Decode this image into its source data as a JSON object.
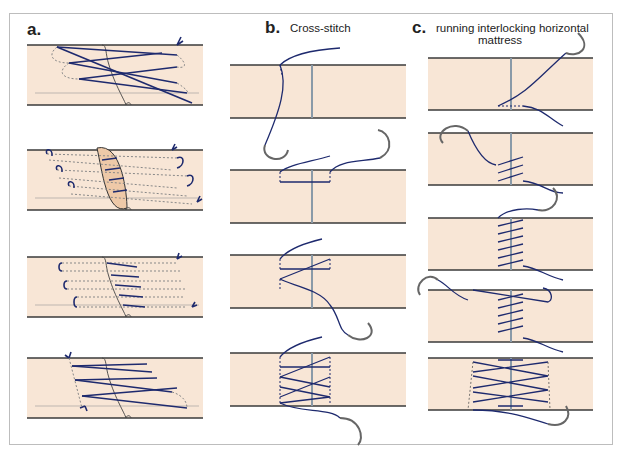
{
  "figure": {
    "panels": [
      {
        "letter": "a.",
        "title": "",
        "steps": 4
      },
      {
        "letter": "b.",
        "title": "Cross-stitch",
        "steps": 4
      },
      {
        "letter": "c.",
        "title_line1": "running interlocking horizontal",
        "title_line2": "mattress",
        "steps": 5
      }
    ],
    "colors": {
      "tissue": "#f8e6d6",
      "tissue_edge": "#3a3a3a",
      "suture": "#1e2a6e",
      "needle": "#555555",
      "gap_line": "#8a9aa8",
      "grasp_region": "#eec9a8"
    }
  }
}
